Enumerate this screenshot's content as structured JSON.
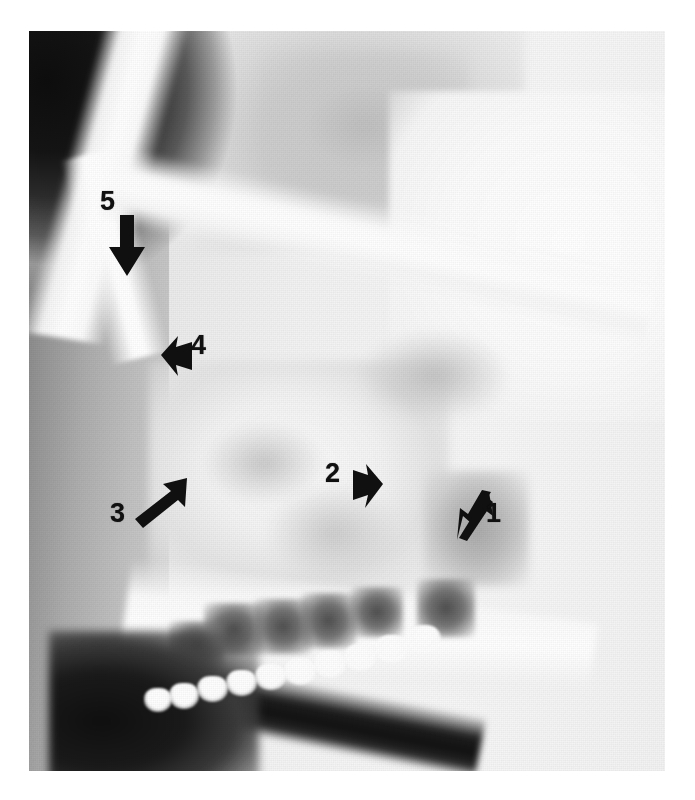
{
  "figure": {
    "kind": "radiograph",
    "modality": "plain-film-lateral-facial-radiograph",
    "view": "lateral",
    "region": "midface-maxilla-nasal",
    "background_color": "#ffffff",
    "plate": {
      "left": 29,
      "top": 31,
      "width": 636,
      "height": 740
    }
  },
  "annotations": {
    "count": 5,
    "marker_color": "#101010",
    "items": [
      {
        "id": "arrow-1",
        "label": "1",
        "direction": "down-left",
        "angle_deg": 215,
        "arrow_x": 455,
        "arrow_y": 490,
        "label_x": 486,
        "label_y": 500
      },
      {
        "id": "arrow-2",
        "label": "2",
        "direction": "right",
        "angle_deg": 0,
        "arrow_x": 352,
        "arrow_y": 462,
        "label_x": 325,
        "label_y": 460
      },
      {
        "id": "arrow-3",
        "label": "3",
        "direction": "up-right",
        "angle_deg": 318,
        "arrow_x": 133,
        "arrow_y": 478,
        "label_x": 110,
        "label_y": 500
      },
      {
        "id": "arrow-4",
        "label": "4",
        "direction": "left",
        "angle_deg": 180,
        "arrow_x": 161,
        "arrow_y": 334,
        "label_x": 191,
        "label_y": 332
      },
      {
        "id": "arrow-5",
        "label": "5",
        "direction": "down",
        "angle_deg": 90,
        "arrow_x": 107,
        "arrow_y": 215,
        "label_x": 100,
        "label_y": 188
      }
    ]
  },
  "anatomy_regions": [
    {
      "name": "air-background-upper-left",
      "tone": "black"
    },
    {
      "name": "soft-tissue-facial-profile",
      "tone": "mid-grey"
    },
    {
      "name": "nasal-bridge-frontal-process",
      "tone": "bright"
    },
    {
      "name": "orbital-floor-zygomatic-arch",
      "tone": "bright-band"
    },
    {
      "name": "frontal-cranial-mass",
      "tone": "grey"
    },
    {
      "name": "maxillary-sinus",
      "tone": "light-mottled"
    },
    {
      "name": "lesion-opacity",
      "tone": "grey-mass"
    },
    {
      "name": "hard-palate-alveolar-ridge",
      "tone": "bright"
    },
    {
      "name": "oral-cavity-air",
      "tone": "black-band"
    },
    {
      "name": "maxillary-tooth-row",
      "tone": "bright-enamel"
    }
  ]
}
